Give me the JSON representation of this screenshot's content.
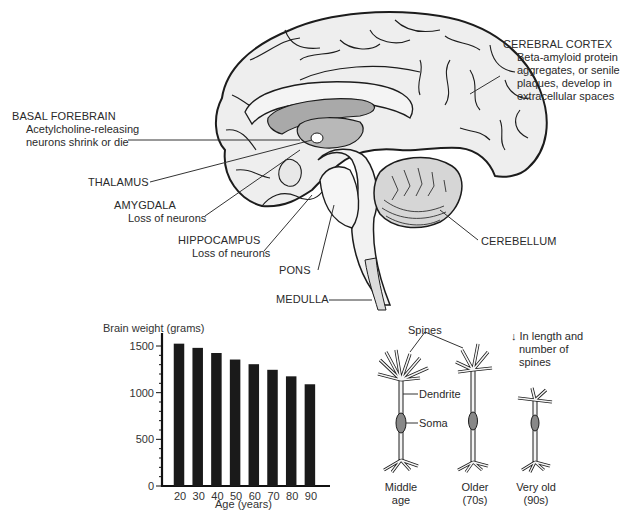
{
  "brain_labels": {
    "cerebral_cortex": {
      "title": "CEREBRAL CORTEX",
      "lines": [
        "Beta-amyloid protein",
        "aggregates, or senile",
        "plaques, develop in",
        "extracellular spaces"
      ]
    },
    "basal_forebrain": {
      "title": "BASAL FOREBRAIN",
      "lines": [
        "Acetylcholine-releasing",
        "neurons shrink or die"
      ]
    },
    "thalamus": {
      "title": "THALAMUS"
    },
    "amygdala": {
      "title": "AMYGDALA",
      "lines": [
        "Loss of neurons"
      ]
    },
    "hippocampus": {
      "title": "HIPPOCAMPUS",
      "lines": [
        "Loss of neurons"
      ]
    },
    "pons": {
      "title": "PONS"
    },
    "medulla": {
      "title": "MEDULLA"
    },
    "cerebellum": {
      "title": "CEREBELLUM"
    }
  },
  "chart_data": {
    "type": "bar",
    "title": "",
    "ylabel": "Brain weight (grams)",
    "xlabel": "Age (years)",
    "categories": [
      "20",
      "30",
      "40",
      "50",
      "60",
      "70",
      "80",
      "90"
    ],
    "values": [
      1525,
      1480,
      1425,
      1355,
      1305,
      1245,
      1175,
      1090
    ],
    "ylim": [
      0,
      1500
    ],
    "yticks": [
      0,
      500,
      1000,
      1500
    ],
    "grid": false,
    "legend": "none",
    "bar_color": "#1a1a1a"
  },
  "neurons": {
    "spines_label": "Spines",
    "dendrite_label": "Dendrite",
    "soma_label": "Soma",
    "note_arrow": "↓",
    "note_lines": [
      "In length and",
      "number of",
      "spines"
    ],
    "captions": [
      {
        "line1": "Middle",
        "line2": "age"
      },
      {
        "line1": "Older",
        "line2": "(70s)"
      },
      {
        "line1": "Very old",
        "line2": "(90s)"
      }
    ]
  },
  "colors": {
    "outline": "#1c1c1c",
    "brain_fill": "#eeeeee",
    "ventricle_fill": "#a9a9a9",
    "mid_gray": "#c8c8c8",
    "leader_line": "#333333"
  }
}
